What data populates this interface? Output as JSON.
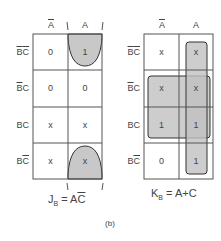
{
  "col_labels": {
    "a_bar": "A",
    "a": "A"
  },
  "row_labels": [
    {
      "b": "B",
      "c": "C",
      "b_bar": true,
      "c_bar": true
    },
    {
      "b": "B",
      "c": "C",
      "b_bar": true,
      "c_bar": false
    },
    {
      "b": "B",
      "c": "C",
      "b_bar": false,
      "c_bar": false
    },
    {
      "b": "B",
      "c": "C",
      "b_bar": false,
      "c_bar": true
    }
  ],
  "jb_map": {
    "cells": [
      [
        "0",
        "1"
      ],
      [
        "0",
        "0"
      ],
      [
        "x",
        "x"
      ],
      [
        "x",
        "x"
      ]
    ],
    "equation": {
      "lhs": "J",
      "sub": "B",
      "rhs_a": "A",
      "rhs_c": "C"
    }
  },
  "kb_map": {
    "cells": [
      [
        "x",
        "x"
      ],
      [
        "x",
        "x"
      ],
      [
        "1",
        "1"
      ],
      [
        "0",
        "1"
      ]
    ],
    "equation": {
      "lhs": "K",
      "sub": "B",
      "rhs": "= A+C"
    }
  },
  "caption": "(b)",
  "colors": {
    "grid": "#555555",
    "fill": "#c8c8c8",
    "group_stroke": "#333333"
  }
}
